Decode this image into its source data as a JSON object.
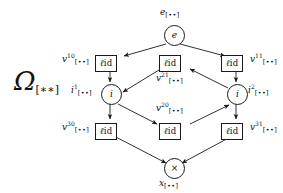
{
  "figure": {
    "kind": "directed-graph",
    "background": "#ffffff",
    "line_color": "#1a1a1a",
    "corner_label": {
      "symbol": "Ω",
      "subscript": "[∗∗]"
    },
    "box_text": {
      "rho": "ℓ",
      "id": "id"
    },
    "nodes": [
      {
        "id": "e",
        "shape": "circle",
        "glyph": "e",
        "label_base": "e",
        "label_sup": "",
        "label_sub": "[••]",
        "label_pos": "above"
      },
      {
        "id": "b10",
        "shape": "box",
        "glyph": "ℓid",
        "label_base": "v",
        "label_sup": "10",
        "label_sub": "[••]",
        "label_pos": "left"
      },
      {
        "id": "b21",
        "shape": "box",
        "glyph": "ℓid",
        "label_base": "v",
        "label_sup": "21",
        "label_sub": "[••]",
        "label_pos": "below"
      },
      {
        "id": "b11",
        "shape": "box",
        "glyph": "ℓid",
        "label_base": "v",
        "label_sup": "11",
        "label_sub": "[••]",
        "label_pos": "right"
      },
      {
        "id": "i1",
        "shape": "circle",
        "glyph": "i",
        "label_base": "i",
        "label_sup": "1",
        "label_sub": "[••]",
        "label_pos": "left"
      },
      {
        "id": "i2",
        "shape": "circle",
        "glyph": "i",
        "label_base": "i",
        "label_sup": "2",
        "label_sub": "[••]",
        "label_pos": "right"
      },
      {
        "id": "b20",
        "shape": "box",
        "glyph": "ℓid",
        "label_base": "v",
        "label_sup": "20",
        "label_sub": "[••]",
        "label_pos": "above"
      },
      {
        "id": "b30",
        "shape": "box",
        "glyph": "ℓid",
        "label_base": "v",
        "label_sup": "30",
        "label_sub": "[••]",
        "label_pos": "left"
      },
      {
        "id": "b31",
        "shape": "box",
        "glyph": "ℓid",
        "label_base": "v",
        "label_sup": "31",
        "label_sub": "[••]",
        "label_pos": "right"
      },
      {
        "id": "x",
        "shape": "circle",
        "glyph": "×",
        "label_base": "x",
        "label_sup": "",
        "label_sub": "[••]",
        "label_pos": "below"
      }
    ],
    "edges": [
      {
        "from": "e",
        "to": "b10"
      },
      {
        "from": "e",
        "to": "b11"
      },
      {
        "from": "b10",
        "to": "i1"
      },
      {
        "from": "b21",
        "to": "i1"
      },
      {
        "from": "b11",
        "to": "i2"
      },
      {
        "from": "i2",
        "to": "b21"
      },
      {
        "from": "i1",
        "to": "b20"
      },
      {
        "from": "b20",
        "to": "i2"
      },
      {
        "from": "i1",
        "to": "b30"
      },
      {
        "from": "i2",
        "to": "b31"
      },
      {
        "from": "b30",
        "to": "x"
      },
      {
        "from": "b31",
        "to": "x"
      }
    ]
  }
}
